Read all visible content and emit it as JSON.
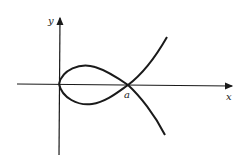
{
  "diagram": {
    "type": "curve-plot",
    "axes": {
      "x_label": "x",
      "y_label": "y"
    },
    "points": {
      "crossing_label": "a"
    },
    "colors": {
      "stroke": "#1a1a1a",
      "background": "#ffffff"
    }
  }
}
